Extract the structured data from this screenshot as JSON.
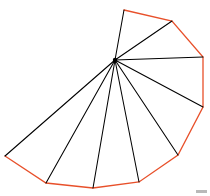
{
  "figure": {
    "canvas": {
      "width": 210,
      "height": 196,
      "background": "#ffffff"
    },
    "colors": {
      "polygon_outline": "#e8502a",
      "triangulation_edges": "#000000",
      "hub_point": "#000000",
      "corner_artifact": "#b9b9b9"
    },
    "hub_label": "apex",
    "hub_point": {
      "x": 115,
      "y": 60
    },
    "polygon_points": "124,10 172,21 203,57 203,107 178,155 139,182 93,188 46,183 5,156",
    "polygon_vertices": [
      {
        "id": "v0",
        "x": 124,
        "y": 10,
        "label": "v0"
      },
      {
        "id": "v1",
        "x": 172,
        "y": 21,
        "label": "v1"
      },
      {
        "id": "v2",
        "x": 203,
        "y": 57,
        "label": "v2"
      },
      {
        "id": "v3",
        "x": 203,
        "y": 107,
        "label": "v3"
      },
      {
        "id": "v4",
        "x": 178,
        "y": 155,
        "label": "v4"
      },
      {
        "id": "v5",
        "x": 139,
        "y": 182,
        "label": "v5"
      },
      {
        "id": "v6",
        "x": 93,
        "y": 188,
        "label": "v6"
      },
      {
        "id": "v7",
        "x": 46,
        "y": 183,
        "label": "v7"
      },
      {
        "id": "v8",
        "x": 5,
        "y": 156,
        "label": "v8"
      }
    ],
    "spokes": [
      {
        "id": "spoke-v0",
        "x1": 115,
        "y1": 60,
        "x2": 124,
        "y2": 10
      },
      {
        "id": "spoke-v1",
        "x1": 115,
        "y1": 60,
        "x2": 172,
        "y2": 21
      },
      {
        "id": "spoke-v2",
        "x1": 115,
        "y1": 60,
        "x2": 203,
        "y2": 57
      },
      {
        "id": "spoke-v3",
        "x1": 115,
        "y1": 60,
        "x2": 203,
        "y2": 107
      },
      {
        "id": "spoke-v4",
        "x1": 115,
        "y1": 60,
        "x2": 178,
        "y2": 155
      },
      {
        "id": "spoke-v5",
        "x1": 115,
        "y1": 60,
        "x2": 139,
        "y2": 182
      },
      {
        "id": "spoke-v6",
        "x1": 115,
        "y1": 60,
        "x2": 93,
        "y2": 188
      },
      {
        "id": "spoke-v7",
        "x1": 115,
        "y1": 60,
        "x2": 46,
        "y2": 183
      },
      {
        "id": "spoke-v8",
        "x1": 115,
        "y1": 60,
        "x2": 5,
        "y2": 156
      }
    ],
    "hub_dot_radius": 2.2,
    "corner_artifact": {
      "x": 196,
      "y": 190,
      "width": 11,
      "height": 3
    },
    "counts": {
      "vertices": 9,
      "spokes": 9,
      "triangles": 8
    }
  }
}
